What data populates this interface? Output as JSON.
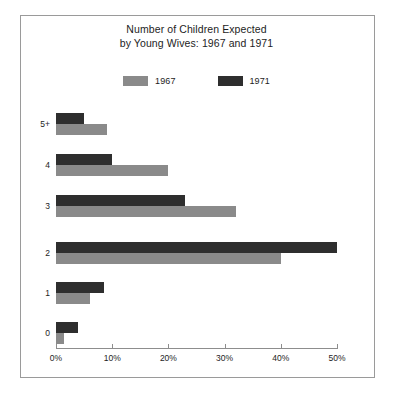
{
  "figure": {
    "title_line1": "Number of Children Expected",
    "title_line2": "by Young Wives: 1967 and 1971",
    "border_color": "#9a9a9a",
    "background": "#ffffff"
  },
  "legend": {
    "position": "top-center",
    "entries": [
      {
        "label": "1967",
        "color": "#8a8a8a"
      },
      {
        "label": "1971",
        "color": "#2e2e2e"
      }
    ]
  },
  "axes": {
    "x_ticks": [
      "0%",
      "10%",
      "20%",
      "30%",
      "40%",
      "50%"
    ],
    "x_tick_values": [
      0,
      10,
      20,
      30,
      40,
      50
    ],
    "y_ticks": [
      "5+",
      "4",
      "3",
      "2",
      "1",
      "0"
    ]
  },
  "chart_data": {
    "type": "bar",
    "orientation": "horizontal",
    "title": "Number of Children Expected by Young Wives: 1967 and 1971",
    "xlabel": "",
    "ylabel": "",
    "categories": [
      "0",
      "1",
      "2",
      "3",
      "4",
      "5+"
    ],
    "series": [
      {
        "name": "1967",
        "color": "#8a8a8a",
        "values": [
          1.5,
          6.0,
          40.0,
          32.0,
          20.0,
          9.0
        ]
      },
      {
        "name": "1971",
        "color": "#2e2e2e",
        "values": [
          4.0,
          8.5,
          50.0,
          23.0,
          10.0,
          5.0
        ]
      }
    ],
    "xlim": [
      0,
      50
    ],
    "xtick_step": 10,
    "unit": "percent",
    "grid": false,
    "legend_position": "top-center"
  }
}
